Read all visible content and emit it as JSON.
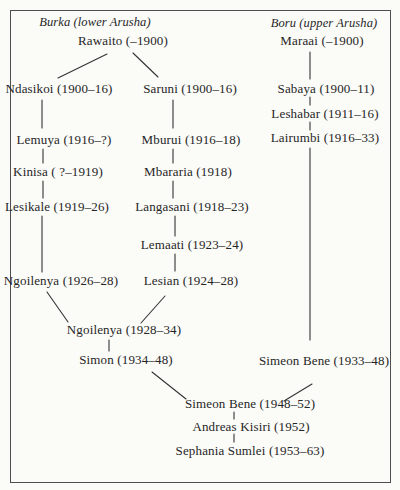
{
  "colors": {
    "paper": "#fbfbf8",
    "ink": "#262626",
    "line": "#333333",
    "border": "#4e4e4e"
  },
  "diagram": {
    "title_left": "Burka (lower Arusha)",
    "title_right": "Boru (upper Arusha)",
    "title_left_pos": {
      "x": 95,
      "y": 22
    },
    "title_right_pos": {
      "x": 324,
      "y": 23
    },
    "nodes": [
      {
        "id": "rawaito",
        "label": "Rawaito (–1900)",
        "x": 123,
        "y": 41
      },
      {
        "id": "maraai",
        "label": "Maraai (–1900)",
        "x": 322,
        "y": 41
      },
      {
        "id": "ndasikoi",
        "label": "Ndasikoi (1900–16)",
        "x": 59,
        "y": 89
      },
      {
        "id": "saruni",
        "label": "Saruni (1900–16)",
        "x": 190,
        "y": 89
      },
      {
        "id": "sabaya",
        "label": "Sabaya (1900–11)",
        "x": 326,
        "y": 89
      },
      {
        "id": "leshabar",
        "label": "Leshabar (1911–16)",
        "x": 325,
        "y": 114
      },
      {
        "id": "lemuya",
        "label": "Lemuya (1916–?)",
        "x": 64,
        "y": 140
      },
      {
        "id": "mburui",
        "label": "Mburui (1916–18)",
        "x": 191,
        "y": 140
      },
      {
        "id": "lairumbi",
        "label": "Lairumbi (1916–33)",
        "x": 325,
        "y": 138
      },
      {
        "id": "kinisa",
        "label": "Kinisa ( ?–1919)",
        "x": 58,
        "y": 172
      },
      {
        "id": "mbararia",
        "label": "Mbararia (1918)",
        "x": 188,
        "y": 172
      },
      {
        "id": "lesikale",
        "label": "Lesikale (1919–26)",
        "x": 57,
        "y": 207
      },
      {
        "id": "langasani",
        "label": "Langasani (1918–23)",
        "x": 192,
        "y": 207
      },
      {
        "id": "lemaati",
        "label": "Lemaati (1923–24)",
        "x": 192,
        "y": 245
      },
      {
        "id": "ngoilenya-1926",
        "label": "Ngoilenya (1926–28)",
        "x": 61,
        "y": 281
      },
      {
        "id": "lesian",
        "label": "Lesian (1924–28)",
        "x": 191,
        "y": 281
      },
      {
        "id": "ngoilenya-1928",
        "label": "Ngoilenya (1928–34)",
        "x": 124,
        "y": 330
      },
      {
        "id": "simon",
        "label": "Simon (1934–48)",
        "x": 126,
        "y": 360
      },
      {
        "id": "simeon-bene-1933",
        "label": "Simeon Bene (1933–48)",
        "x": 324,
        "y": 361
      },
      {
        "id": "simeon-bene-1948",
        "label": "Simeon Bene (1948–52)",
        "x": 250,
        "y": 404
      },
      {
        "id": "andreas-kisiri",
        "label": "Andreas Kisiri (1952)",
        "x": 251,
        "y": 427
      },
      {
        "id": "sephania-sumlei",
        "label": "Sephania Sumlei (1953–63)",
        "x": 250,
        "y": 451
      }
    ],
    "edges": [
      {
        "from": "rawaito",
        "to": "ndasikoi",
        "x1": 107,
        "y1": 54,
        "x2": 58,
        "y2": 78
      },
      {
        "from": "rawaito",
        "to": "saruni",
        "x1": 133,
        "y1": 53,
        "x2": 158,
        "y2": 77
      },
      {
        "from": "ndasikoi",
        "to": "lemuya",
        "x1": 42,
        "y1": 100,
        "x2": 42,
        "y2": 128
      },
      {
        "from": "lemuya",
        "to": "kinisa",
        "x1": 43,
        "y1": 149,
        "x2": 43,
        "y2": 163
      },
      {
        "from": "kinisa",
        "to": "lesikale",
        "x1": 43,
        "y1": 181,
        "x2": 43,
        "y2": 198
      },
      {
        "from": "lesikale",
        "to": "ngoilenya-1926",
        "x1": 42,
        "y1": 216,
        "x2": 42,
        "y2": 272
      },
      {
        "from": "ngoilenya-1926",
        "to": "ngoilenya-1928",
        "x1": 47,
        "y1": 292,
        "x2": 68,
        "y2": 322
      },
      {
        "from": "saruni",
        "to": "mburui",
        "x1": 173,
        "y1": 100,
        "x2": 173,
        "y2": 128
      },
      {
        "from": "mburui",
        "to": "mbararia",
        "x1": 173,
        "y1": 149,
        "x2": 173,
        "y2": 163
      },
      {
        "from": "mbararia",
        "to": "langasani",
        "x1": 173,
        "y1": 181,
        "x2": 173,
        "y2": 198
      },
      {
        "from": "langasani",
        "to": "lemaati",
        "x1": 175,
        "y1": 216,
        "x2": 175,
        "y2": 236
      },
      {
        "from": "lemaati",
        "to": "lesian",
        "x1": 175,
        "y1": 254,
        "x2": 175,
        "y2": 271
      },
      {
        "from": "lesian",
        "to": "ngoilenya-1928",
        "x1": 165,
        "y1": 296,
        "x2": 141,
        "y2": 323
      },
      {
        "from": "ngoilenya-1928",
        "to": "simon",
        "x1": 109,
        "y1": 340,
        "x2": 109,
        "y2": 351
      },
      {
        "from": "simon",
        "to": "simeon-bene-1948",
        "x1": 152,
        "y1": 372,
        "x2": 186,
        "y2": 399
      },
      {
        "from": "maraai",
        "to": "sabaya",
        "x1": 310,
        "y1": 52,
        "x2": 310,
        "y2": 79
      },
      {
        "from": "sabaya",
        "to": "leshabar",
        "x1": 310,
        "y1": 97,
        "x2": 310,
        "y2": 105
      },
      {
        "from": "leshabar",
        "to": "lairumbi",
        "x1": 310,
        "y1": 122,
        "x2": 310,
        "y2": 130
      },
      {
        "from": "lairumbi",
        "to": "simeon-bene-1933",
        "x1": 310,
        "y1": 148,
        "x2": 310,
        "y2": 340
      },
      {
        "from": "simeon-bene-1933",
        "to": "simeon-bene-1948",
        "x1": 312,
        "y1": 384,
        "x2": 284,
        "y2": 401
      },
      {
        "from": "simeon-bene-1948",
        "to": "andreas-kisiri",
        "x1": 234,
        "y1": 412,
        "x2": 234,
        "y2": 419
      },
      {
        "from": "andreas-kisiri",
        "to": "sephania-sumlei",
        "x1": 234,
        "y1": 434,
        "x2": 234,
        "y2": 442
      }
    ]
  }
}
